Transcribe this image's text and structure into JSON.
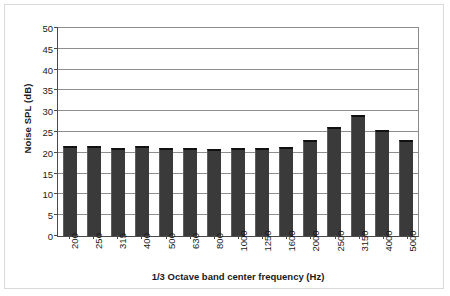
{
  "chart_data": {
    "type": "bar",
    "title": "",
    "xlabel": "1/3 Octave band center frequency (Hz)",
    "ylabel": "Noise SPL (dB)",
    "categories": [
      "200",
      "250",
      "315",
      "400",
      "500",
      "630",
      "800",
      "1000",
      "1250",
      "1600",
      "2000",
      "2500",
      "3150",
      "4000",
      "5000"
    ],
    "values": [
      21.7,
      21.6,
      21.2,
      21.6,
      21.2,
      21.1,
      20.9,
      21.1,
      21.2,
      21.5,
      23.0,
      26.2,
      29.0,
      25.6,
      23.0
    ],
    "ylim": [
      0,
      50
    ],
    "yticks": [
      0,
      5,
      10,
      15,
      20,
      25,
      30,
      35,
      40,
      45,
      50
    ],
    "ytick_labels": [
      "0",
      "5",
      "10",
      "15",
      "20",
      "25",
      "30",
      "35",
      "40",
      "45",
      "50"
    ],
    "grid": true,
    "grid_axis": "y",
    "legend": false,
    "bar_color": "#3a3a3a",
    "gridline_color": "#8e8e8e",
    "axis_color": "#4a4a4a",
    "frame_color": "#d9d9d9",
    "background": "#ffffff"
  }
}
